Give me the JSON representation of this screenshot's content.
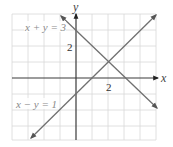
{
  "diagram": {
    "type": "coordinate-plane",
    "axes": {
      "x_label": "x",
      "y_label": "y"
    },
    "ticks": {
      "x_label": "2",
      "y_label": "2"
    },
    "grid": {
      "x_min": -4,
      "x_max": 5,
      "y_min": -4,
      "y_max": 4,
      "step": 1
    },
    "lines": [
      {
        "equation": "x + y = 3",
        "label": "x + y = 3",
        "color": "#707070"
      },
      {
        "equation": "x − y = 1",
        "label": "x − y = 1",
        "color": "#707070"
      }
    ],
    "intersection": {
      "x": 2,
      "y": 1
    }
  }
}
